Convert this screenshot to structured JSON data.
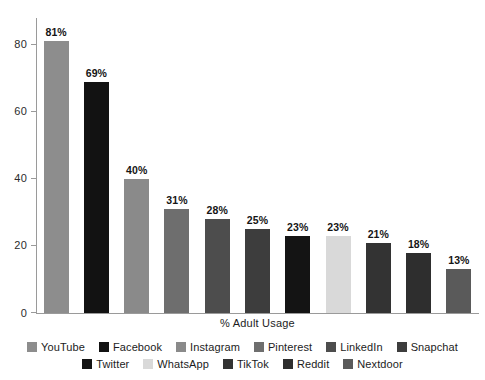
{
  "chart_data": {
    "type": "bar",
    "title": "",
    "subtitle": "",
    "xlabel": "% Adult Usage",
    "ylabel": "",
    "ylim": [
      0,
      88
    ],
    "yticks": [
      0,
      20,
      40,
      60,
      80
    ],
    "ytick_labels": [
      "0",
      "20",
      "40",
      "60",
      "80"
    ],
    "grid": false,
    "legend_position": "bottom",
    "categories": [
      "YouTube",
      "Facebook",
      "Instagram",
      "Pinterest",
      "LinkedIn",
      "Snapchat",
      "Twitter",
      "WhatsApp",
      "TikTok",
      "Reddit",
      "Nextdoor"
    ],
    "values": [
      81,
      69,
      40,
      31,
      28,
      25,
      23,
      23,
      21,
      18,
      13
    ],
    "value_labels": [
      "81%",
      "69%",
      "40%",
      "31%",
      "28%",
      "25%",
      "23%",
      "23%",
      "21%",
      "18%",
      "13%"
    ],
    "colors": [
      "#8d8d8d",
      "#121212",
      "#8a8a8a",
      "#6e6e6e",
      "#4d4d4d",
      "#3d3d3d",
      "#141414",
      "#d9d9d9",
      "#333333",
      "#2e2e2e",
      "#5a5a5a"
    ],
    "bars": [
      {
        "category": "YouTube",
        "value": 81,
        "label": "81%",
        "color": "#8d8d8d"
      },
      {
        "category": "Facebook",
        "value": 69,
        "label": "69%",
        "color": "#121212"
      },
      {
        "category": "Instagram",
        "value": 40,
        "label": "40%",
        "color": "#8a8a8a"
      },
      {
        "category": "Pinterest",
        "value": 31,
        "label": "31%",
        "color": "#6e6e6e"
      },
      {
        "category": "LinkedIn",
        "value": 28,
        "label": "28%",
        "color": "#4d4d4d"
      },
      {
        "category": "Snapchat",
        "value": 25,
        "label": "25%",
        "color": "#3d3d3d"
      },
      {
        "category": "Twitter",
        "value": 23,
        "label": "23%",
        "color": "#141414"
      },
      {
        "category": "WhatsApp",
        "value": 23,
        "label": "23%",
        "color": "#d9d9d9"
      },
      {
        "category": "TikTok",
        "value": 21,
        "label": "21%",
        "color": "#333333"
      },
      {
        "category": "Reddit",
        "value": 18,
        "label": "18%",
        "color": "#2e2e2e"
      },
      {
        "category": "Nextdoor",
        "value": 13,
        "label": "13%",
        "color": "#5a5a5a"
      }
    ],
    "legend_rows": [
      [
        {
          "label": "YouTube",
          "color": "#8d8d8d"
        },
        {
          "label": "Facebook",
          "color": "#121212"
        },
        {
          "label": "Instagram",
          "color": "#8a8a8a"
        },
        {
          "label": "Pinterest",
          "color": "#6e6e6e"
        },
        {
          "label": "LinkedIn",
          "color": "#4d4d4d"
        },
        {
          "label": "Snapchat",
          "color": "#3d3d3d"
        }
      ],
      [
        {
          "label": "Twitter",
          "color": "#141414"
        },
        {
          "label": "WhatsApp",
          "color": "#d9d9d9"
        },
        {
          "label": "TikTok",
          "color": "#333333"
        },
        {
          "label": "Reddit",
          "color": "#2e2e2e"
        },
        {
          "label": "Nextdoor",
          "color": "#5a5a5a"
        }
      ]
    ],
    "axis_color": "#9a9a9a"
  }
}
